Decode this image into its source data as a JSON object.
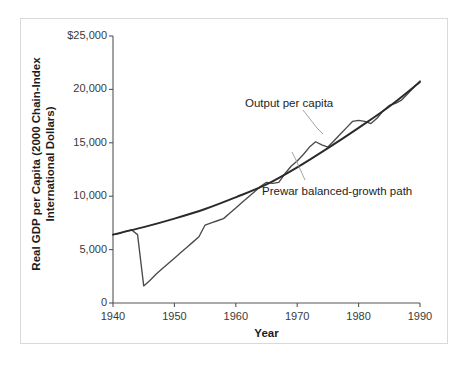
{
  "chart_data": {
    "type": "line",
    "title": "",
    "xlabel": "Year",
    "ylabel": "Real GDP per Capita (2000 Chain-Index International Dollars)",
    "ylabel_line1": "Real GDP per Capita (2000 Chain-Index",
    "ylabel_line2": "International Dollars)",
    "xlim": [
      1940,
      1990
    ],
    "ylim": [
      0,
      25000
    ],
    "xticks": [
      1940,
      1950,
      1960,
      1970,
      1980,
      1990
    ],
    "xtick_labels": [
      "1940",
      "1950",
      "1960",
      "1970",
      "1980",
      "1990"
    ],
    "yticks": [
      0,
      5000,
      10000,
      15000,
      20000,
      25000
    ],
    "ytick_labels": [
      "0",
      "5,000",
      "10,000",
      "15,000",
      "20,000",
      "$25,000"
    ],
    "grid": false,
    "legend_position": "inline-annotations",
    "series": [
      {
        "name": "Output per capita",
        "color": "#4a4a4a",
        "x": [
          1940,
          1941,
          1942,
          1943,
          1944,
          1945,
          1946,
          1947,
          1948,
          1949,
          1950,
          1951,
          1952,
          1953,
          1954,
          1955,
          1956,
          1957,
          1958,
          1959,
          1960,
          1961,
          1962,
          1963,
          1964,
          1965,
          1966,
          1967,
          1968,
          1969,
          1970,
          1971,
          1972,
          1973,
          1974,
          1975,
          1976,
          1977,
          1978,
          1979,
          1980,
          1981,
          1982,
          1983,
          1984,
          1985,
          1986,
          1987,
          1988,
          1989,
          1990
        ],
        "values": [
          6400,
          6500,
          6700,
          6850,
          6400,
          1600,
          2100,
          2700,
          3200,
          3700,
          4200,
          4700,
          5200,
          5700,
          6200,
          7300,
          7500,
          7700,
          7900,
          8400,
          8900,
          9400,
          9900,
          10400,
          10900,
          11300,
          11200,
          11300,
          12100,
          12800,
          13300,
          13900,
          14600,
          15100,
          14800,
          14600,
          15200,
          15800,
          16400,
          17000,
          17100,
          17000,
          16800,
          17300,
          18000,
          18500,
          18700,
          19000,
          19600,
          20200,
          20800
        ]
      },
      {
        "name": "Prewar balanced-growth path",
        "color": "#2a2a2a",
        "x": [
          1940,
          1945,
          1950,
          1955,
          1960,
          1965,
          1970,
          1975,
          1980,
          1985,
          1990
        ],
        "values": [
          6400,
          7100,
          7900,
          8800,
          9900,
          11100,
          12700,
          14500,
          16400,
          18400,
          20700
        ]
      }
    ],
    "annotations": [
      {
        "label": "Output per capita",
        "target_x": 1973,
        "target_y": 15100
      },
      {
        "label": "Prewar balanced-growth path",
        "target_x": 1969,
        "target_y": 12600
      }
    ]
  }
}
